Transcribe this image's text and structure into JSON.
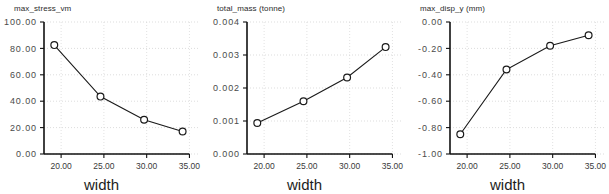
{
  "figure": {
    "background_color": "#ffffff",
    "panel_count": 3,
    "shared_xlabel": "width"
  },
  "chart_data": [
    {
      "type": "line",
      "title": "max_stress_vm",
      "xlabel": "width",
      "ylabel": "",
      "x": [
        19.2,
        24.6,
        29.7,
        34.2
      ],
      "values": [
        82.5,
        43.5,
        26.0,
        17.0
      ],
      "xlim": [
        18.0,
        36.0
      ],
      "ylim": [
        0.0,
        100.0
      ],
      "xticks": [
        20.0,
        25.0,
        30.0,
        35.0
      ],
      "xtick_labels": [
        "20.00",
        "25.00",
        "30.00",
        "35.00"
      ],
      "yticks": [
        0.0,
        20.0,
        40.0,
        60.0,
        80.0,
        100.0
      ],
      "ytick_labels": [
        "0.00",
        "20.00",
        "40.00",
        "60.00",
        "80.00",
        "100.00"
      ],
      "grid": true,
      "legend": null,
      "marker": "circle-open",
      "line_color": "#1a1a1a"
    },
    {
      "type": "line",
      "title": "total_mass (tonne)",
      "xlabel": "width",
      "ylabel": "",
      "x": [
        19.2,
        24.6,
        29.7,
        34.2
      ],
      "values": [
        0.00094,
        0.0016,
        0.00232,
        0.00324
      ],
      "xlim": [
        18.0,
        36.0
      ],
      "ylim": [
        0.0,
        0.004
      ],
      "xticks": [
        20.0,
        25.0,
        30.0,
        35.0
      ],
      "xtick_labels": [
        "20.00",
        "25.00",
        "30.00",
        "35.00"
      ],
      "yticks": [
        0.0,
        0.001,
        0.002,
        0.003,
        0.004
      ],
      "ytick_labels": [
        "0.000",
        "0.001",
        "0.002",
        "0.003",
        "0.004"
      ],
      "grid": true,
      "legend": null,
      "marker": "circle-open",
      "line_color": "#1a1a1a"
    },
    {
      "type": "line",
      "title": "max_disp_y (mm)",
      "xlabel": "width",
      "ylabel": "",
      "x": [
        19.2,
        24.6,
        29.7,
        34.2
      ],
      "values": [
        -0.85,
        -0.36,
        -0.18,
        -0.1
      ],
      "xlim": [
        18.0,
        36.0
      ],
      "ylim": [
        -1.0,
        0.0
      ],
      "xticks": [
        20.0,
        25.0,
        30.0,
        35.0
      ],
      "xtick_labels": [
        "20.00",
        "25.00",
        "30.00",
        "35.00"
      ],
      "yticks": [
        -1.0,
        -0.8,
        -0.6,
        -0.4,
        -0.2,
        0.0
      ],
      "ytick_labels": [
        "-1.00",
        "-0.80",
        "-0.60",
        "-0.40",
        "-0.20",
        "0.00"
      ],
      "grid": true,
      "legend": null,
      "marker": "circle-open",
      "line_color": "#1a1a1a"
    }
  ]
}
